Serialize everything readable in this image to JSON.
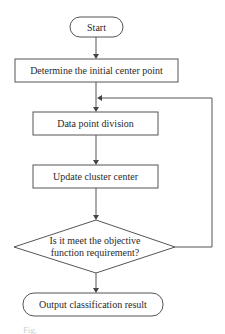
{
  "diagram": {
    "type": "flowchart",
    "nodes": [
      {
        "id": "start",
        "shape": "terminal",
        "label": "Start"
      },
      {
        "id": "init",
        "shape": "process",
        "label": "Determine the initial center point"
      },
      {
        "id": "divide",
        "shape": "process",
        "label": "Data point division"
      },
      {
        "id": "update",
        "shape": "process",
        "label": "Update cluster center"
      },
      {
        "id": "check",
        "shape": "decision",
        "label_line1": "Is it meet the objective",
        "label_line2": "function requirement?"
      },
      {
        "id": "output",
        "shape": "terminal",
        "label": "Output classification result"
      }
    ],
    "edges": [
      {
        "from": "start",
        "to": "init"
      },
      {
        "from": "init",
        "to": "divide"
      },
      {
        "from": "divide",
        "to": "update"
      },
      {
        "from": "update",
        "to": "check"
      },
      {
        "from": "check",
        "to": "output"
      },
      {
        "from": "check",
        "to": "divide",
        "kind": "loop-back"
      }
    ],
    "caption": "Fig."
  },
  "colors": {
    "stroke": "#555555",
    "text": "#2a2a2a",
    "background": "#ffffff"
  }
}
